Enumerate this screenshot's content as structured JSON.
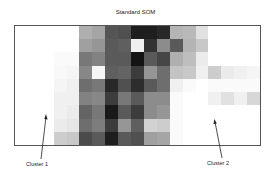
{
  "title": "Standard SOM",
  "labels": {
    "cluster1": "Cluster 1",
    "cluster2": "Cluster 2"
  },
  "grid": {
    "cols": 19,
    "rows": 9,
    "values": [
      [
        255,
        255,
        255,
        255,
        255,
        175,
        165,
        85,
        80,
        30,
        30,
        40,
        180,
        185,
        225,
        255,
        255,
        255,
        255
      ],
      [
        255,
        255,
        255,
        255,
        255,
        160,
        150,
        90,
        95,
        240,
        50,
        140,
        90,
        180,
        200,
        255,
        255,
        255,
        255
      ],
      [
        255,
        255,
        255,
        250,
        250,
        120,
        130,
        90,
        90,
        20,
        90,
        70,
        175,
        190,
        235,
        255,
        255,
        255,
        255
      ],
      [
        255,
        255,
        255,
        248,
        245,
        135,
        245,
        95,
        100,
        60,
        150,
        110,
        195,
        200,
        240,
        205,
        235,
        240,
        245
      ],
      [
        255,
        255,
        255,
        245,
        240,
        110,
        120,
        40,
        80,
        45,
        90,
        110,
        240,
        250,
        255,
        250,
        250,
        250,
        250
      ],
      [
        255,
        255,
        255,
        240,
        240,
        130,
        135,
        60,
        120,
        90,
        140,
        140,
        250,
        255,
        255,
        240,
        225,
        240,
        215
      ],
      [
        255,
        255,
        255,
        240,
        235,
        100,
        120,
        25,
        90,
        60,
        140,
        150,
        250,
        255,
        255,
        255,
        255,
        255,
        255
      ],
      [
        255,
        255,
        255,
        235,
        230,
        110,
        125,
        60,
        150,
        95,
        210,
        205,
        250,
        255,
        255,
        255,
        255,
        255,
        255
      ],
      [
        255,
        255,
        255,
        205,
        200,
        75,
        90,
        30,
        90,
        80,
        160,
        165,
        250,
        255,
        255,
        255,
        255,
        255,
        255
      ]
    ]
  }
}
